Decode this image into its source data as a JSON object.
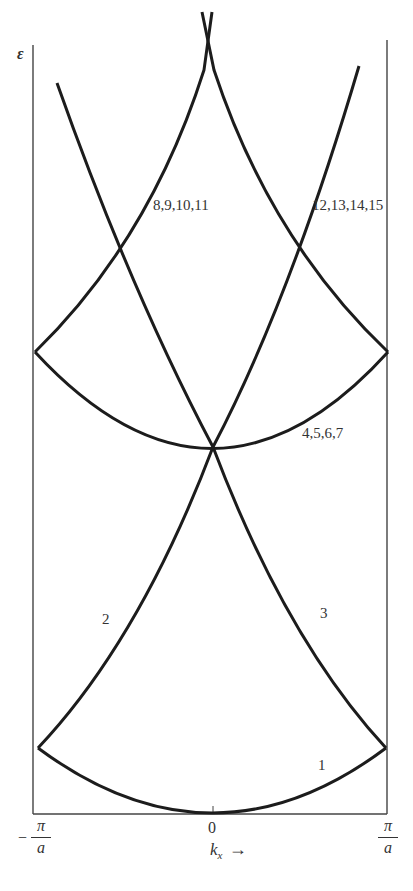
{
  "figure": {
    "y_axis_label": "ε",
    "x_axis_label": "k",
    "x_axis_subscript": "x",
    "x_axis_arrow": "→",
    "x_ticks": {
      "left": {
        "sign": "−",
        "numerator": "π",
        "denominator": "a"
      },
      "center": "0",
      "right": {
        "numerator": "π",
        "denominator": "a"
      }
    },
    "band_labels": {
      "band1": "1",
      "band2": "2",
      "band3": "3",
      "bands4_7": "4,5,6,7",
      "bands8_11": "8,9,10,11",
      "bands12_15": "12,13,14,15"
    },
    "line_color": "#1c1c1c",
    "axis_color": "#444444"
  }
}
